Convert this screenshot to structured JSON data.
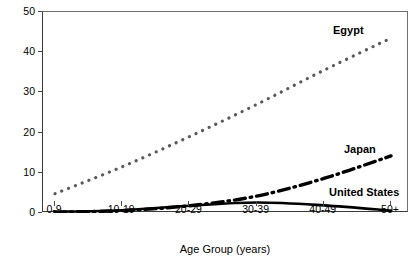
{
  "chart_data": {
    "type": "line",
    "title": "",
    "xlabel": "Age Group (years)",
    "ylabel": "Anti-HCV Positive (%)",
    "categories": [
      "0-9",
      "10-19",
      "20-29",
      "30-39",
      "40-49",
      "50+"
    ],
    "yticks": [
      0,
      10,
      20,
      30,
      40,
      50
    ],
    "ylim": [
      0,
      50
    ],
    "grid": false,
    "legend_position": "inline-annotations",
    "series": [
      {
        "name": "Egypt",
        "style": "dotted",
        "color": "#595959",
        "values": [
          4.8,
          11.5,
          19.0,
          27.0,
          35.5,
          43.5
        ]
      },
      {
        "name": "Japan",
        "style": "dash-dot",
        "color": "#000000",
        "values": [
          0.2,
          0.6,
          1.8,
          4.2,
          8.6,
          14.2
        ]
      },
      {
        "name": "United States",
        "style": "solid",
        "color": "#000000",
        "values": [
          0.3,
          0.7,
          1.8,
          2.6,
          1.9,
          0.6
        ]
      }
    ]
  },
  "annotations": {
    "egypt": "Egypt",
    "japan": "Japan",
    "united_states": "United States"
  }
}
